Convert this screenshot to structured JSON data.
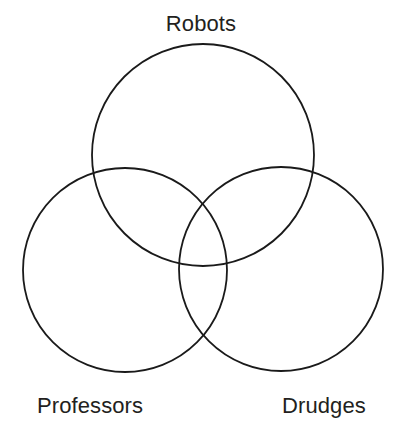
{
  "figure": {
    "kind": "venn-diagram",
    "title": "",
    "width": 402,
    "height": 439,
    "background_color": "#ffffff",
    "stroke_color": "#1a1a1a",
    "stroke_width": 1.8,
    "fill": "none",
    "label_color": "#231f20",
    "label_font_size": 22
  },
  "sets": [
    {
      "id": "robots",
      "label": "Robots",
      "label_position": "top-center",
      "circle": {
        "cx": 203,
        "cy": 155,
        "r": 111
      }
    },
    {
      "id": "professors",
      "label": "Professors",
      "label_position": "bottom-left",
      "circle": {
        "cx": 125,
        "cy": 270,
        "r": 102
      }
    },
    {
      "id": "drudges",
      "label": "Drudges",
      "label_position": "bottom-right",
      "circle": {
        "cx": 281,
        "cy": 269,
        "r": 102
      }
    }
  ],
  "regions": [
    {
      "id": "robots-only",
      "sets": [
        "robots"
      ],
      "text": ""
    },
    {
      "id": "professors-only",
      "sets": [
        "professors"
      ],
      "text": ""
    },
    {
      "id": "drudges-only",
      "sets": [
        "drudges"
      ],
      "text": ""
    },
    {
      "id": "robots-professors",
      "sets": [
        "robots",
        "professors"
      ],
      "text": ""
    },
    {
      "id": "robots-drudges",
      "sets": [
        "robots",
        "drudges"
      ],
      "text": ""
    },
    {
      "id": "professors-drudges",
      "sets": [
        "professors",
        "drudges"
      ],
      "text": ""
    },
    {
      "id": "all-three",
      "sets": [
        "robots",
        "professors",
        "drudges"
      ],
      "text": ""
    }
  ]
}
